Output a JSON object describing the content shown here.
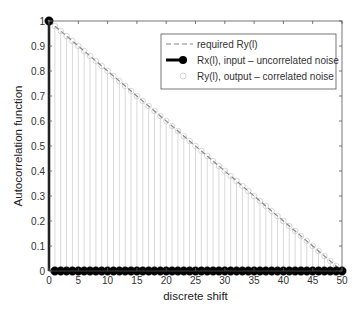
{
  "chart_data": {
    "type": "line",
    "title": "",
    "xlabel": "discrete shift",
    "ylabel": "Autocorrelation function",
    "xlim": [
      0,
      50
    ],
    "ylim": [
      0,
      1
    ],
    "xticks": [
      0,
      5,
      10,
      15,
      20,
      25,
      30,
      35,
      40,
      45,
      50
    ],
    "yticks": [
      0,
      0.1,
      0.2,
      0.3,
      0.4,
      0.5,
      0.6,
      0.7,
      0.8,
      0.9,
      1
    ],
    "xtick_labels": [
      "0",
      "5",
      "10",
      "15",
      "20",
      "25",
      "30",
      "35",
      "40",
      "45",
      "50"
    ],
    "ytick_labels": [
      "0",
      "0.1",
      "0.2",
      "0.3",
      "0.4",
      "0.5",
      "0.6",
      "0.7",
      "0.8",
      "0.9",
      "1"
    ],
    "grid": false,
    "legend_position": "top-right",
    "series": [
      {
        "name": "required Ry(l)",
        "style": "dashed-line",
        "color": "#888888",
        "x": [
          0,
          50
        ],
        "y": [
          1,
          0
        ]
      },
      {
        "name": "Rx(l), input – uncorrelated noise",
        "style": "stem-filled-marker",
        "color": "#000000",
        "x_range": [
          0,
          50
        ],
        "description": "1 at l=0, 0 for l=1..50",
        "y_at_zero": 1,
        "y_elsewhere": 0
      },
      {
        "name": "Ry(l), output – correlated noise",
        "style": "stem-open-marker",
        "color": "#bbbbbb",
        "x_range": [
          0,
          50
        ],
        "description": "Ry(l) = 1 - l/50 for l=0..50",
        "formula": "1 - l/50"
      }
    ]
  }
}
